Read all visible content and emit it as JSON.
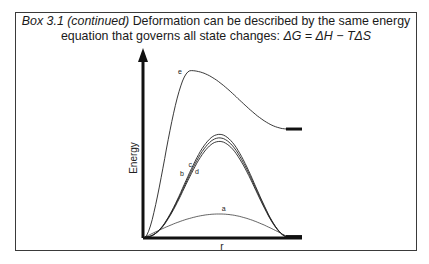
{
  "caption": {
    "prefix_italic": "Box 3.1 (continued)",
    "text_line1": " Deformation can be described by the same energy",
    "text_line2": "equation that governs all state changes: ",
    "equation": "ΔG = ΔH − TΔS"
  },
  "chart_data": {
    "type": "line",
    "title": "",
    "xlabel": "r",
    "ylabel": "Energy",
    "xlim": [
      0,
      1
    ],
    "ylim": [
      0,
      1
    ],
    "grid": false,
    "legend": "none (curves labeled inline)",
    "series": [
      {
        "name": "a",
        "label": "a",
        "peak_x": 0.52,
        "peak_y": 0.13,
        "end_y": 0.0
      },
      {
        "name": "b",
        "label": "b",
        "peak_x": 0.52,
        "peak_y": 0.58,
        "end_y": 0.0
      },
      {
        "name": "c",
        "label": "c",
        "peak_x": 0.52,
        "peak_y": 0.56,
        "end_y": 0.0
      },
      {
        "name": "d",
        "label": "d",
        "peak_x": 0.52,
        "peak_y": 0.54,
        "end_y": 0.0
      },
      {
        "name": "e",
        "label": "e",
        "peak_x": 0.32,
        "peak_y": 0.94,
        "end_y": 0.61
      }
    ]
  }
}
